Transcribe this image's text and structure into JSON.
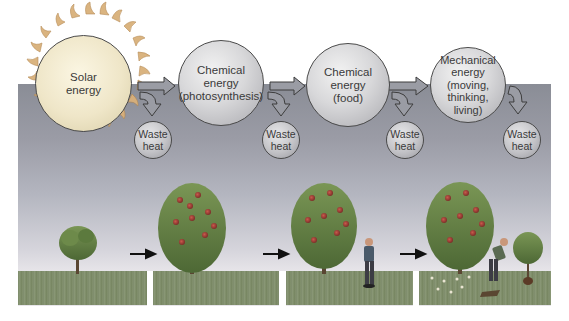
{
  "diagram": {
    "stages": [
      {
        "id": "solar",
        "lines": [
          "Solar",
          "energy"
        ]
      },
      {
        "id": "photosynthesis",
        "lines": [
          "Chemical energy",
          "(photosynthesis)"
        ]
      },
      {
        "id": "food",
        "lines": [
          "Chemical",
          "energy",
          "(food)"
        ]
      },
      {
        "id": "mechanical",
        "lines": [
          "Mechanical",
          "energy",
          "(moving,",
          "thinking,",
          "living)"
        ]
      }
    ],
    "waste_heat": [
      {
        "lines": [
          "Waste",
          "heat"
        ]
      },
      {
        "lines": [
          "Waste",
          "heat"
        ]
      },
      {
        "lines": [
          "Waste",
          "heat"
        ]
      },
      {
        "lines": [
          "Waste",
          "heat"
        ]
      }
    ],
    "panels": [
      {
        "id": "small-tree",
        "description": "small young tree on grass"
      },
      {
        "id": "large-tree",
        "description": "large fruit-bearing tree"
      },
      {
        "id": "tree-and-person",
        "description": "fruit tree with person eating fruit"
      },
      {
        "id": "tree-person-working",
        "description": "fruit tree, person digging, young potted tree, fallen fruit"
      }
    ],
    "colors": {
      "band_top": "#8a8d96",
      "band_bottom": "#e8e6ea",
      "grass": "#7c8a6a",
      "tree_foliage": "#5f7a45",
      "fruit": "#a8423a",
      "sun_rays": "#c9a16e",
      "circle_border": "#4a4a4a"
    }
  }
}
